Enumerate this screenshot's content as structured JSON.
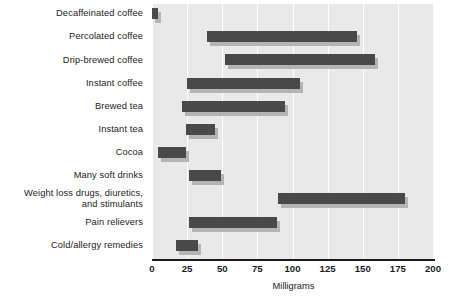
{
  "chart_data": {
    "type": "bar",
    "orientation": "horizontal",
    "subtype": "range-bar",
    "title": "",
    "xlabel": "Milligrams",
    "ylabel": "",
    "xlim": [
      0,
      200
    ],
    "ylim": null,
    "grid": true,
    "legend": null,
    "xticks": [
      0,
      25,
      50,
      75,
      100,
      125,
      150,
      175,
      200
    ],
    "xticklabels": [
      "0",
      "25",
      "50",
      "75",
      "100",
      "125",
      "150",
      "175",
      "200"
    ],
    "categories": [
      "Decaffeinated coffee",
      "Percolated coffee",
      "Drip-brewed coffee",
      "Instant coffee",
      "Brewed tea",
      "Instant tea",
      "Cocoa",
      "Many soft drinks",
      "Weight loss drugs, diuretics,\nand stimulants",
      "Pain relievers",
      "Cold/allergy remedies"
    ],
    "ranges": [
      {
        "category": "Decaffeinated coffee",
        "low": 0,
        "high": 4
      },
      {
        "category": "Percolated coffee",
        "low": 39,
        "high": 146
      },
      {
        "category": "Drip-brewed coffee",
        "low": 52,
        "high": 159
      },
      {
        "category": "Instant coffee",
        "low": 25,
        "high": 105
      },
      {
        "category": "Brewed tea",
        "low": 21,
        "high": 95
      },
      {
        "category": "Instant tea",
        "low": 24,
        "high": 45
      },
      {
        "category": "Cocoa",
        "low": 4,
        "high": 24
      },
      {
        "category": "Many soft drinks",
        "low": 26,
        "high": 49
      },
      {
        "category": "Weight loss drugs, diuretics,\nand stimulants",
        "low": 90,
        "high": 180
      },
      {
        "category": "Pain relievers",
        "low": 26,
        "high": 89
      },
      {
        "category": "Cold/allergy remedies",
        "low": 17,
        "high": 33
      }
    ],
    "colors": {
      "bar": "#494949",
      "bar_shadow": "#b4b4b4",
      "plot_background": "#e9e9e9",
      "gridline": "#ffffff",
      "axis": "#1b1b1b",
      "text": "#1b1b1b",
      "page_background": "#ffffff"
    }
  }
}
